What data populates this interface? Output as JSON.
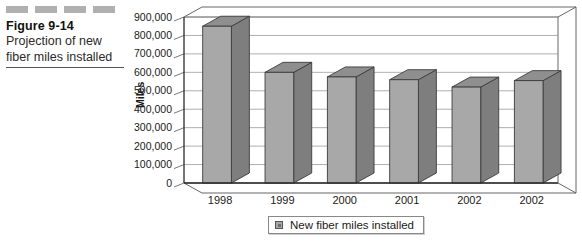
{
  "caption": {
    "figure_number": "Figure 9-14",
    "description_line1": "Projection of new",
    "description_line2": "fiber miles installed",
    "decor_dash_count": 4
  },
  "legend": {
    "entry_label": "New fiber miles installed",
    "swatch_name": "series-swatch"
  },
  "colors": {
    "bar_front": "#a8a8a8",
    "bar_side": "#7e7e7e",
    "bar_top": "#8f8f8f",
    "bar_outline": "#3c3c3c",
    "gridline": "#9a9a9a",
    "axis": "#2b2b2b",
    "plot_background": "#ffffff",
    "floor": "#ffffff",
    "caption_dash": "#b0b0b0",
    "text": "#1a1a1a"
  },
  "chart_data": {
    "type": "bar",
    "title": "Projection of new fiber miles installed",
    "xlabel": "",
    "ylabel": "Miles",
    "categories": [
      "1998",
      "1999",
      "2000",
      "2001",
      "2002",
      "2002"
    ],
    "values": [
      850000,
      600000,
      575000,
      560000,
      520000,
      555000
    ],
    "series": [
      {
        "name": "New fiber miles installed",
        "values": [
          850000,
          600000,
          575000,
          560000,
          520000,
          555000
        ]
      }
    ],
    "ylim": [
      0,
      900000
    ],
    "ytick_values": [
      0,
      100000,
      200000,
      300000,
      400000,
      500000,
      600000,
      700000,
      800000,
      900000
    ],
    "ytick_labels": [
      "0",
      "100,000",
      "200,000",
      "300,000",
      "400,000",
      "500,000",
      "600,000",
      "700,000",
      "800,000",
      "900,000"
    ],
    "grid": true,
    "grid_axis": "y",
    "legend_position": "bottom",
    "three_d": true,
    "note": "Sixth category label is printed as 2002 in the source figure"
  }
}
